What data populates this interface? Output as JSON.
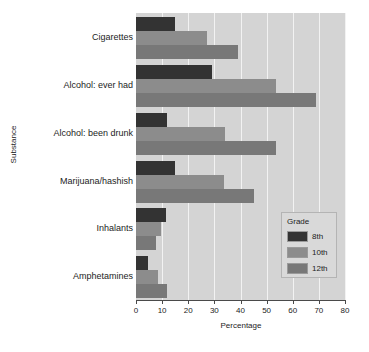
{
  "chart_data": {
    "type": "bar",
    "orientation": "horizontal",
    "title": "",
    "xlabel": "Percentage",
    "ylabel": "Substance",
    "xlim": [
      0,
      80
    ],
    "xticks": [
      0,
      10,
      20,
      30,
      40,
      50,
      60,
      70,
      80
    ],
    "grid": true,
    "legend": {
      "title": "Grade",
      "position": "bottom-right-inside"
    },
    "categories": [
      "Cigarettes",
      "Alcohol: ever had",
      "Alcohol: been drunk",
      "Marijuana/hashish",
      "Inhalants",
      "Amphetamines"
    ],
    "series": [
      {
        "name": "8th",
        "color": "#333333",
        "values": [
          15,
          29,
          12,
          15,
          11.5,
          4.5
        ]
      },
      {
        "name": "10th",
        "color": "#8c8c8c",
        "values": [
          27,
          53.5,
          34,
          33.5,
          9.5,
          8.5
        ]
      },
      {
        "name": "12th",
        "color": "#787878",
        "values": [
          39,
          69,
          53.5,
          45,
          7.5,
          12
        ]
      }
    ]
  },
  "axis": {
    "x_title": "Percentage",
    "y_title": "Substance",
    "tick_labels": [
      "0",
      "10",
      "20",
      "30",
      "40",
      "50",
      "60",
      "70",
      "80"
    ]
  },
  "legend": {
    "title": "Grade",
    "entries": [
      {
        "label": "8th",
        "color": "#333333"
      },
      {
        "label": "10th",
        "color": "#8c8c8c"
      },
      {
        "label": "12th",
        "color": "#787878"
      }
    ]
  },
  "colors": {
    "plot_background": "#d4d4d4",
    "gridline": "#f2f2f2",
    "axis": "#4a4a4a",
    "page_background": "#ffffff"
  }
}
